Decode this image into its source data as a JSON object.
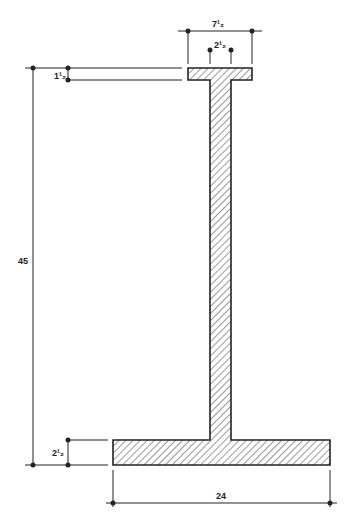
{
  "diagram": {
    "type": "I-beam cross section (asymmetric)",
    "colors": {
      "line": "#222222",
      "hatch": "#333333",
      "background": "#ffffff"
    },
    "dimensions": {
      "top_flange_width": "7½",
      "web_thickness": "2½",
      "top_flange_thickness": "1½",
      "overall_height": "45",
      "bottom_flange_thickness": "2½",
      "bottom_flange_width": "24"
    },
    "labels": {
      "top_width": "7¹₂",
      "web": "2¹₂",
      "top_thk": "1¹₂",
      "height": "45",
      "bot_thk": "2¹₂",
      "bot_width": "24"
    }
  }
}
